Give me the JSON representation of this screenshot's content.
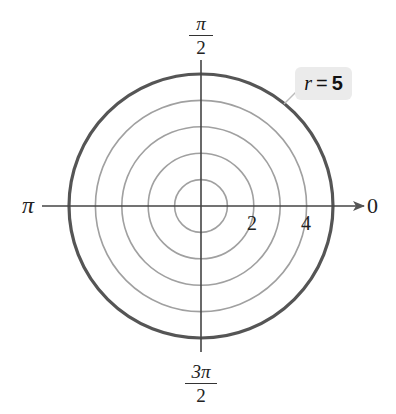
{
  "diagram": {
    "type": "polar-grid",
    "center_px": [
      201,
      206
    ],
    "unit_px": 26.4,
    "grid_circles": [
      1,
      2,
      3,
      4
    ],
    "highlighted_circle": {
      "r": 5,
      "color": "#555555"
    },
    "grid_color": "#a0a0a0",
    "axis_color": "#444444"
  },
  "angle_labels": {
    "top": {
      "num": "π",
      "den": "2"
    },
    "bottom": {
      "num": "3π",
      "den": "2"
    },
    "left": "π",
    "right": "0"
  },
  "radial_ticks": [
    "2",
    "4"
  ],
  "callout": {
    "var": "r",
    "eq": "=",
    "val": "5"
  }
}
